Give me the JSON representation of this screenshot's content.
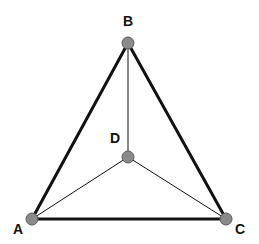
{
  "diagram": {
    "type": "tetrahedron-graph",
    "nodes": [
      {
        "id": "A",
        "label": "A",
        "x": 32,
        "y": 219,
        "lx": 18,
        "ly": 234
      },
      {
        "id": "B",
        "label": "B",
        "x": 128,
        "y": 43,
        "lx": 128,
        "ly": 26
      },
      {
        "id": "C",
        "label": "C",
        "x": 226,
        "y": 219,
        "lx": 240,
        "ly": 234
      },
      {
        "id": "D",
        "label": "D",
        "x": 128,
        "y": 157,
        "lx": 115,
        "ly": 143
      }
    ],
    "edges": [
      {
        "from": "A",
        "to": "B",
        "weight": "thick"
      },
      {
        "from": "B",
        "to": "C",
        "weight": "thick"
      },
      {
        "from": "A",
        "to": "C",
        "weight": "thick"
      },
      {
        "from": "B",
        "to": "D",
        "weight": "thin"
      },
      {
        "from": "A",
        "to": "D",
        "weight": "thin"
      },
      {
        "from": "C",
        "to": "D",
        "weight": "thin"
      }
    ],
    "colors": {
      "node_fill": "#8a8a8a",
      "node_stroke": "#5a5a5a",
      "edge": "#111111"
    }
  }
}
